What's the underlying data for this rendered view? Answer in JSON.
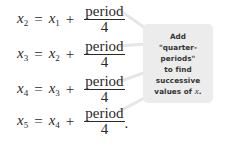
{
  "equations": [
    {
      "lhs_var": "x",
      "lhs_sub": "2",
      "eq": "=",
      "rhs_var": "x",
      "rhs_sub": "1",
      "plus": "+",
      "numerator": "period",
      "denominator": "4",
      "trailing": ""
    },
    {
      "lhs_var": "x",
      "lhs_sub": "3",
      "eq": "=",
      "rhs_var": "x",
      "rhs_sub": "2",
      "plus": "+",
      "numerator": "period",
      "denominator": "4",
      "trailing": ""
    },
    {
      "lhs_var": "x",
      "lhs_sub": "4",
      "eq": "=",
      "rhs_var": "x",
      "rhs_sub": "3",
      "plus": "+",
      "numerator": "period",
      "denominator": "4",
      "trailing": ""
    },
    {
      "lhs_var": "x",
      "lhs_sub": "5",
      "eq": "=",
      "rhs_var": "x",
      "rhs_sub": "4",
      "plus": "+",
      "numerator": "period",
      "denominator": "4",
      "trailing": "."
    }
  ],
  "callout": {
    "lines": [
      "Add",
      "\"quarter-periods\"",
      "to find",
      "successive",
      "values of"
    ],
    "var": "x",
    "end": ".",
    "background": "#ececec"
  }
}
